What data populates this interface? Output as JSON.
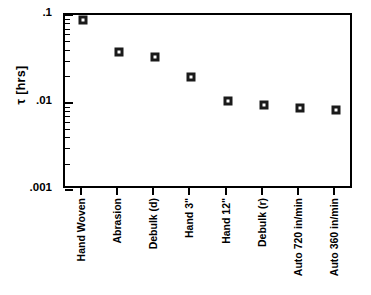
{
  "chart_data": {
    "type": "scatter",
    "title": "",
    "xlabel": "",
    "ylabel": "τ [hrs]",
    "ylim": [
      0.001,
      0.1
    ],
    "yscale": "log",
    "grid": false,
    "legend": null,
    "ytick_labels": [
      ".1",
      ".01",
      ".001"
    ],
    "ytick_values": [
      0.1,
      0.01,
      0.001
    ],
    "categories": [
      "Hand Woven",
      "Abrasion",
      "Debulk (d)",
      "Hand 3\"",
      "Hand 12\"",
      "Debulk (r)",
      "Auto 720 in/min",
      "Auto 360 in/min"
    ],
    "values": [
      0.088,
      0.038,
      0.033,
      0.0195,
      0.0105,
      0.0094,
      0.0086,
      0.0083
    ],
    "marker": "open-square",
    "marker_color": "#1a1a1a"
  },
  "axes": {
    "y_title": "τ [hrs]",
    "y_labels": [
      {
        "text": ".1",
        "value": 0.1
      },
      {
        "text": ".01",
        "value": 0.01
      },
      {
        "text": ".001",
        "value": 0.001
      }
    ]
  },
  "series": {
    "points": [
      {
        "label": "Hand Woven",
        "value": 0.088
      },
      {
        "label": "Abrasion",
        "value": 0.038
      },
      {
        "label": "Debulk (d)",
        "value": 0.033
      },
      {
        "label": "Hand 3\"",
        "value": 0.0195
      },
      {
        "label": "Hand 12\"",
        "value": 0.0105
      },
      {
        "label": "Debulk (r)",
        "value": 0.0094
      },
      {
        "label": "Auto 720 in/min",
        "value": 0.0086
      },
      {
        "label": "Auto 360 in/min",
        "value": 0.0083
      }
    ]
  }
}
